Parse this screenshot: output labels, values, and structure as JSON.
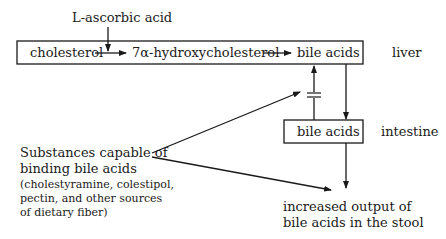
{
  "diagram": {
    "inhibitor": {
      "prefix": "L",
      "label": "-ascorbic acid"
    },
    "liver_pathway": {
      "nodes": [
        "cholesterol",
        "7α-hydroxycholesterol",
        "bile acids"
      ],
      "region_label": "liver"
    },
    "intestine": {
      "node": "bile acids",
      "region_label": "intestine"
    },
    "binders": {
      "title_line1": "Substances capable of",
      "title_line2": "binding bile acids",
      "examples_line1": "(cholestyramine, colestipol,",
      "examples_line2": "pectin, and other sources",
      "examples_line3": "of dietary fiber)"
    },
    "outcome": {
      "line1": "increased output of",
      "line2": "bile acids in the stool"
    }
  }
}
